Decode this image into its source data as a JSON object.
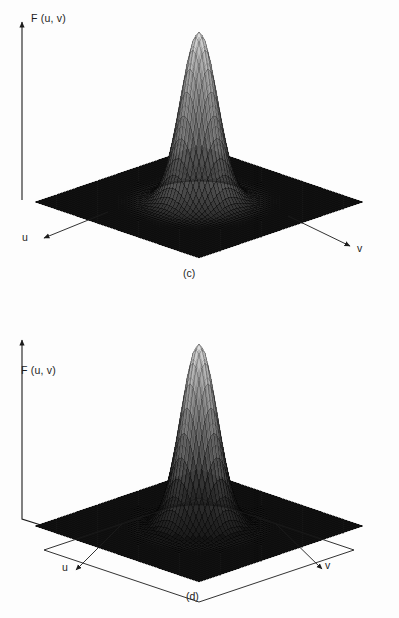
{
  "figure": {
    "background_color": "#fdfdfd",
    "ink_color": "#1c1c1c",
    "mesh_color": "#2b2b2b"
  },
  "panels": [
    {
      "id": "c",
      "caption": "(c)",
      "vertical_axis_label": "F (u, v)",
      "u_axis_label": "u",
      "v_axis_label": "v",
      "surface": "gaussian-lowpass-peak"
    },
    {
      "id": "d",
      "caption": "(d)",
      "vertical_axis_label": "F (u, v)",
      "u_axis_label": "u",
      "v_axis_label": "v",
      "surface": "gaussian-highpass-well"
    }
  ],
  "chart_data": {
    "type": "surface",
    "title": "",
    "charts": [
      {
        "id": "c",
        "caption": "(c)",
        "title": "",
        "xlabel": "u",
        "ylabel": "v",
        "zlabel": "F (u, v)",
        "projection": "3d-perspective-wireframe",
        "grid": true,
        "legend": "none",
        "function": "F(u,v) = exp(-(u^2+v^2)/(2*D0^2))",
        "description": "Gaussian lowpass filter transfer function: single central peak rising from a flat zero plane",
        "xlim": [
          -1,
          1
        ],
        "ylim": [
          -1,
          1
        ],
        "zlim": [
          0,
          1
        ],
        "peak_value": 1.0,
        "baseline_value": 0.0,
        "D0": 0.16,
        "mesh_n": 56,
        "profile_radius": [
          0.0,
          0.05,
          0.1,
          0.15,
          0.2,
          0.25,
          0.3,
          0.35,
          0.4,
          0.5,
          0.6,
          0.8,
          1.0
        ],
        "profile_value": [
          1.0,
          0.954,
          0.826,
          0.649,
          0.458,
          0.294,
          0.172,
          0.091,
          0.044,
          0.007,
          0.001,
          0.0,
          0.0
        ]
      },
      {
        "id": "d",
        "caption": "(d)",
        "title": "",
        "xlabel": "u",
        "ylabel": "v",
        "zlabel": "F (u, v)",
        "projection": "3d-perspective-wireframe",
        "grid": true,
        "legend": "none",
        "function": "F(u,v) = 1 - exp(-(u^2+v^2)/(2*D0^2))",
        "description": "Gaussian highpass filter transfer function: central well dipping below a flat unit plane",
        "xlim": [
          -1,
          1
        ],
        "ylim": [
          -1,
          1
        ],
        "zlim": [
          0,
          1
        ],
        "peak_value": 1.0,
        "baseline_value": 1.0,
        "well_minimum": 0.0,
        "D0": 0.16,
        "mesh_n": 56,
        "profile_radius": [
          0.0,
          0.05,
          0.1,
          0.15,
          0.2,
          0.25,
          0.3,
          0.35,
          0.4,
          0.5,
          0.6,
          0.8,
          1.0
        ],
        "profile_value": [
          0.0,
          0.046,
          0.174,
          0.351,
          0.542,
          0.706,
          0.828,
          0.909,
          0.956,
          0.993,
          0.999,
          1.0,
          1.0
        ]
      }
    ]
  }
}
